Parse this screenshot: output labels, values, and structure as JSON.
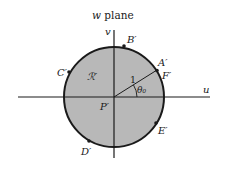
{
  "diagram": {
    "title": "w plane",
    "axes": {
      "horizontal_label": "u",
      "vertical_label": "v"
    },
    "region_label": "ℛ′",
    "center_label": "P′",
    "radius_label": "1",
    "angle_label": "θ₀",
    "points": [
      {
        "id": "A",
        "label": "A′"
      },
      {
        "id": "F",
        "label": "F′"
      },
      {
        "id": "B",
        "label": "B′"
      },
      {
        "id": "C",
        "label": "C′"
      },
      {
        "id": "D",
        "label": "D′"
      },
      {
        "id": "E",
        "label": "E′"
      }
    ],
    "colors": {
      "disk_fill": "#b8b8b8",
      "stroke": "#1a1a1a",
      "background": "#ffffff"
    }
  }
}
